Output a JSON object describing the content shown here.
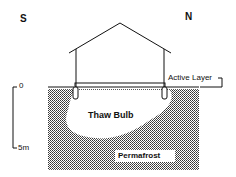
{
  "diagram": {
    "compass": {
      "south": "S",
      "north": "N"
    },
    "labels": {
      "active_layer": "Active Layer",
      "thaw_bulb": "Thaw Bulb",
      "permafrost": "Permafrost"
    },
    "scale": {
      "top": "0",
      "bottom": "5m"
    },
    "colors": {
      "ink": "#111111",
      "background": "#ffffff"
    }
  }
}
